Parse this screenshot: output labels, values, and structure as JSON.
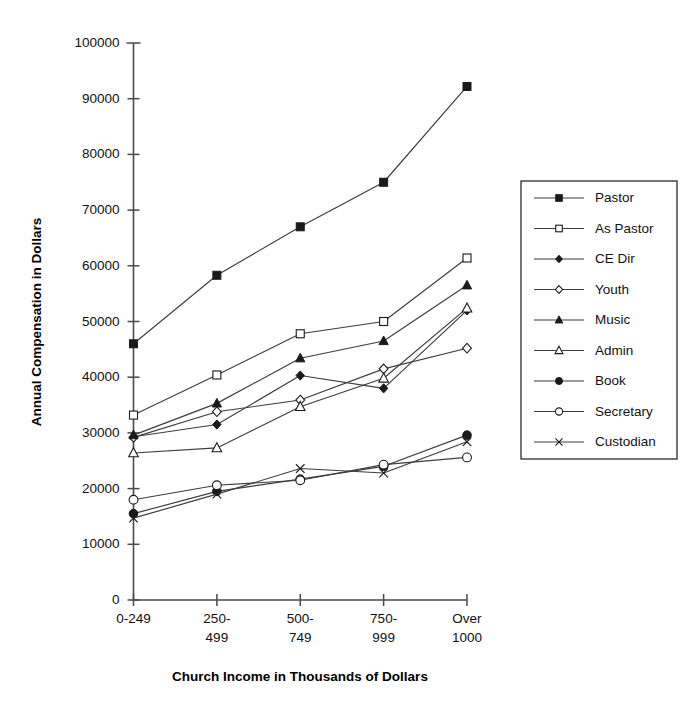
{
  "chart_data": {
    "type": "line",
    "title": "",
    "xlabel": "Church Income in Thousands of Dollars",
    "ylabel": "Annual Compensation in Dollars",
    "categories": [
      "0-249",
      "250-499",
      "500-749",
      "750-999",
      "Over 1000"
    ],
    "category_lines": [
      [
        "0-249"
      ],
      [
        "250-",
        "499"
      ],
      [
        "500-",
        "749"
      ],
      [
        "750-",
        "999"
      ],
      [
        "Over",
        "1000"
      ]
    ],
    "ylim": [
      0,
      100000
    ],
    "yticks": [
      0,
      10000,
      20000,
      30000,
      40000,
      50000,
      60000,
      70000,
      80000,
      90000,
      100000
    ],
    "ytick_labels": [
      "0",
      "10000",
      "20000",
      "30000",
      "40000",
      "50000",
      "60000",
      "70000",
      "80000",
      "90000",
      "100000"
    ],
    "grid": false,
    "legend_position": "right",
    "series": [
      {
        "name": "Pastor",
        "marker": "filled-square",
        "values": [
          46000,
          58300,
          67000,
          75000,
          92200
        ]
      },
      {
        "name": "As Pastor",
        "marker": "open-square",
        "values": [
          33200,
          40400,
          47800,
          50000,
          61400
        ]
      },
      {
        "name": "CE Dir",
        "marker": "filled-diamond",
        "values": [
          29300,
          31500,
          40300,
          38000,
          52000
        ]
      },
      {
        "name": "Youth",
        "marker": "open-diamond",
        "values": [
          29200,
          33800,
          35900,
          41500,
          45200
        ]
      },
      {
        "name": "Music",
        "marker": "filled-triangle",
        "values": [
          29600,
          35300,
          43400,
          46500,
          56500
        ]
      },
      {
        "name": "Admin",
        "marker": "open-triangle",
        "values": [
          26400,
          27300,
          34700,
          39800,
          52400
        ]
      },
      {
        "name": "Book",
        "marker": "filled-circle",
        "values": [
          15500,
          19500,
          21700,
          24000,
          29600
        ]
      },
      {
        "name": "Secretary",
        "marker": "open-circle",
        "values": [
          18000,
          20600,
          21500,
          24300,
          25600
        ]
      },
      {
        "name": "Custodian",
        "marker": "cross",
        "values": [
          14700,
          19000,
          23600,
          22800,
          28400
        ]
      }
    ]
  },
  "legend": {
    "entries": [
      {
        "label": "Pastor"
      },
      {
        "label": "As Pastor"
      },
      {
        "label": "CE Dir"
      },
      {
        "label": "Youth"
      },
      {
        "label": "Music"
      },
      {
        "label": "Admin"
      },
      {
        "label": "Book"
      },
      {
        "label": "Secretary"
      },
      {
        "label": "Custodian"
      }
    ]
  },
  "colors": {
    "line": "#3d3d3d",
    "marker": "#1a1a1a",
    "axis": "#4a4a4a",
    "text": "#111111",
    "background": "#ffffff"
  }
}
